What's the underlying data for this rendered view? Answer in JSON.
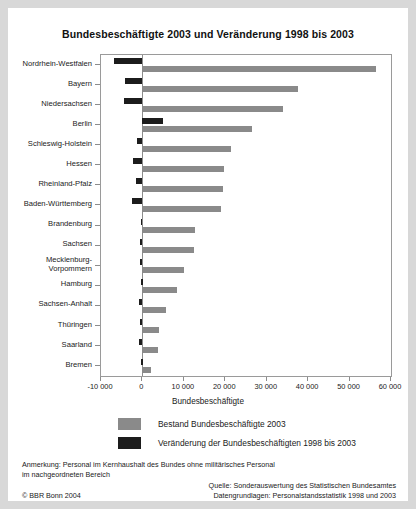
{
  "chart_data": {
    "type": "bar",
    "orientation": "horizontal",
    "title": "Bundesbeschäftigte 2003 und Veränderung 1998 bis 2003",
    "xlabel": "Bundesbeschäftigte",
    "ylabel": "",
    "xlim": [
      -10000,
      60000
    ],
    "xticks": [
      -10000,
      0,
      10000,
      20000,
      30000,
      40000,
      50000,
      60000
    ],
    "xticklabels": [
      "-10 000",
      "0",
      "10 000",
      "20 000",
      "30 000",
      "40 000",
      "50 000",
      "60 000"
    ],
    "grid": false,
    "legend_position": "bottom",
    "categories": [
      "Nordrhein-Westfalen",
      "Bayern",
      "Niedersachsen",
      "Berlin",
      "Schleswig-Holstein",
      "Hessen",
      "Rheinland-Pfalz",
      "Baden-Württemberg",
      "Brandenburg",
      "Sachsen",
      "Mecklenburg-\nVorpommern",
      "Hamburg",
      "Sachsen-Anhalt",
      "Thüringen",
      "Saarland",
      "Bremen"
    ],
    "series": [
      {
        "name": "Bestand Bundesbeschäftigte 2003",
        "color": "#8a8a8a",
        "values": [
          56500,
          37500,
          34000,
          26500,
          21500,
          19700,
          19500,
          19000,
          12700,
          12400,
          10000,
          8300,
          5600,
          4000,
          3800,
          2000
        ]
      },
      {
        "name": "Veränderung der Bundesbeschäftigten 1998 bis 2003",
        "color": "#1c1c1c",
        "values": [
          -6800,
          -4300,
          -4500,
          5000,
          -1200,
          -2200,
          -1500,
          -2500,
          -400,
          -600,
          -700,
          -300,
          -800,
          -500,
          -900,
          -300
        ]
      }
    ]
  },
  "legend": {
    "items": [
      {
        "label": "Bestand Bundesbeschäftigte 2003",
        "swatch": "stock"
      },
      {
        "label": "Veränderung der Bundesbeschäftigten 1998 bis 2003",
        "swatch": "change"
      }
    ]
  },
  "footer": {
    "note_line1": "Anmerkung: Personal im Kernhaushalt des Bundes ohne militärisches Personal",
    "note_line2": "im nachgeordneten Bereich",
    "source_line1": "Quelle: Sonderauswertung des Statistischen Bundesamtes",
    "source_line2": "Datengrundlagen: Personalstandsstatistik 1998 und 2003",
    "copyright": "© BBR Bonn 2004"
  }
}
